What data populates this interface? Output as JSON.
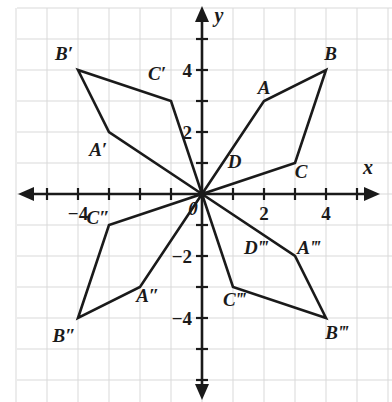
{
  "figure": {
    "kind": "coordinate-plane-rotations",
    "axes": {
      "x_label": "x",
      "y_label": "y",
      "origin_label": "0"
    },
    "tick_labels": {
      "x": [
        {
          "text": "−4",
          "value": -4
        },
        {
          "text": "2",
          "value": 2
        },
        {
          "text": "4",
          "value": 4
        }
      ],
      "y": [
        {
          "text": "4",
          "value": 4
        },
        {
          "text": "2",
          "value": 2
        },
        {
          "text": "−2",
          "value": -2
        },
        {
          "text": "−4",
          "value": -4
        }
      ]
    },
    "grid": {
      "visible": true,
      "unit_spacing_px": 31,
      "x_range": [
        -6,
        6
      ],
      "y_range": [
        -6,
        6
      ],
      "color": "#d9d9d9"
    },
    "colors": {
      "stroke": "#1a1a1a",
      "grid": "#d9d9d9",
      "background": "#ffffff",
      "text": "#1a1a1a"
    },
    "shapes": [
      {
        "name": "original-quadrilateral",
        "quadrant": 1,
        "points": [
          [
            0,
            0
          ],
          [
            2,
            3
          ],
          [
            4,
            4
          ],
          [
            3,
            1
          ]
        ],
        "labels": [
          {
            "text": "A",
            "x": 2.0,
            "y": 3.45
          },
          {
            "text": "B",
            "x": 4.15,
            "y": 4.55
          },
          {
            "text": "C",
            "x": 3.2,
            "y": 0.75
          },
          {
            "text": "D",
            "x": 1.05,
            "y": 1.05
          }
        ]
      },
      {
        "name": "image-prime-quadrilateral",
        "quadrant": 2,
        "points": [
          [
            0,
            0
          ],
          [
            -3,
            2
          ],
          [
            -4,
            4
          ],
          [
            -1,
            3
          ]
        ],
        "labels": [
          {
            "text": "A′",
            "x": -3.35,
            "y": 1.45
          },
          {
            "text": "B′",
            "x": -4.45,
            "y": 4.55
          },
          {
            "text": "C′",
            "x": -1.45,
            "y": 3.9
          }
        ]
      },
      {
        "name": "image-double-prime-quadrilateral",
        "quadrant": 3,
        "points": [
          [
            0,
            0
          ],
          [
            -2,
            -3
          ],
          [
            -4,
            -4
          ],
          [
            -3,
            -1
          ]
        ],
        "labels": [
          {
            "text": "A″",
            "x": -1.75,
            "y": -3.25
          },
          {
            "text": "B″",
            "x": -4.45,
            "y": -4.55
          },
          {
            "text": "C″",
            "x": -3.35,
            "y": -0.75
          }
        ]
      },
      {
        "name": "image-triple-prime-quadrilateral",
        "quadrant": 4,
        "points": [
          [
            0,
            0
          ],
          [
            3,
            -2
          ],
          [
            4,
            -4
          ],
          [
            1,
            -3
          ]
        ],
        "labels": [
          {
            "text": "A‴",
            "x": 3.45,
            "y": -1.7
          },
          {
            "text": "B‴",
            "x": 4.35,
            "y": -4.45
          },
          {
            "text": "C‴",
            "x": 1.05,
            "y": -3.4
          },
          {
            "text": "D‴",
            "x": 1.75,
            "y": -1.7
          }
        ]
      }
    ]
  }
}
